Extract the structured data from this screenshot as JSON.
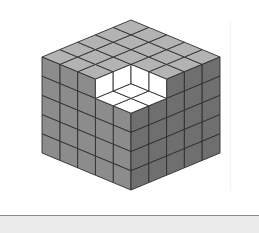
{
  "figure": {
    "grid_size": 5,
    "removed_block": {
      "layers_from_top": 1,
      "width_left": 2,
      "width_right": 2
    },
    "geometry": {
      "front_top_corner": [
        131,
        94
      ],
      "left_step": [
        -17.8,
        -7.4
      ],
      "right_step": [
        17.8,
        -7.4
      ],
      "down_step": [
        0,
        19.2
      ]
    },
    "colors": {
      "top_face": "#b3b3b3",
      "left_face": "#8c8c8c",
      "right_face": "#6f6f6f",
      "cut_face": "#ffffff",
      "edge": "#2e2e2e",
      "background": "#ffffff",
      "bottom_bar": "#ececec"
    }
  }
}
